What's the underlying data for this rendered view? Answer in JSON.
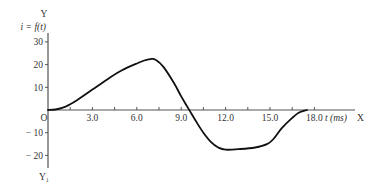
{
  "chart_data": {
    "type": "line",
    "title": "",
    "xlabel": "t (ms)",
    "ylabel": "i = f(t)",
    "x_axis_name": "X",
    "y_axis_name": "Y",
    "y_negative_axis_name": "Y₁",
    "origin_label": "O",
    "xlim": [
      0,
      20.5
    ],
    "ylim": [
      -25,
      35
    ],
    "grid": false,
    "legend": null,
    "x_ticks": [
      1.5,
      3.0,
      4.5,
      6.0,
      7.5,
      9.0,
      10.5,
      12.0,
      13.5,
      15.0,
      16.5,
      18.0
    ],
    "x_tick_labels": [
      "3.0",
      "6.0",
      "9.0",
      "12.0",
      "15.0",
      "18.0"
    ],
    "x_tick_label_values": [
      3.0,
      6.0,
      9.0,
      12.0,
      15.0,
      18.0
    ],
    "y_ticks": [
      30,
      20,
      10,
      -10,
      -20
    ],
    "y_tick_labels": [
      "30",
      "20",
      "10",
      "− 10",
      "− 20"
    ],
    "series": [
      {
        "name": "i = f(t)",
        "x": [
          0,
          0.5,
          1.0,
          1.5,
          2.0,
          3.0,
          4.0,
          5.0,
          6.0,
          6.5,
          7.0,
          7.3,
          7.8,
          8.5,
          9.0,
          9.5,
          10.0,
          10.5,
          11.0,
          11.5,
          12.0,
          13.0,
          14.0,
          14.8,
          15.2,
          15.8,
          16.5,
          17.0,
          17.5
        ],
        "y": [
          0,
          0.2,
          1.0,
          2.5,
          4.5,
          9.0,
          13.5,
          17.5,
          20.5,
          21.8,
          22.5,
          22.0,
          19.0,
          12.0,
          6.0,
          0.5,
          -5.0,
          -10.0,
          -14.0,
          -16.5,
          -17.5,
          -17.2,
          -16.5,
          -15.0,
          -13.0,
          -8.0,
          -3.5,
          -1.0,
          0
        ]
      }
    ]
  }
}
